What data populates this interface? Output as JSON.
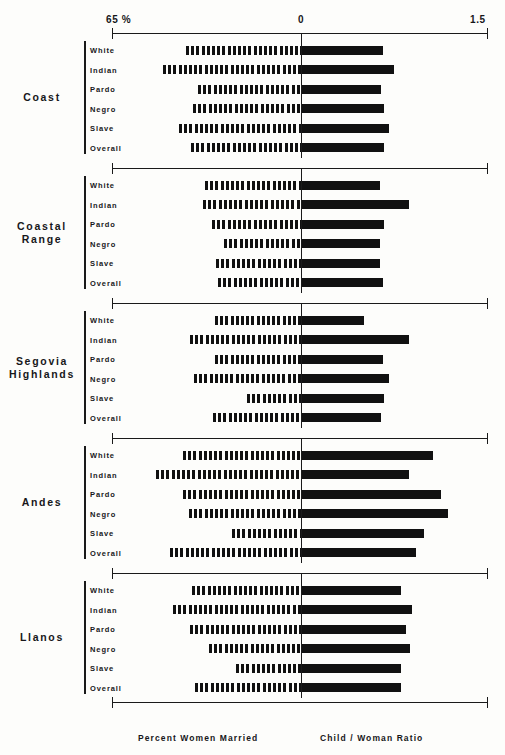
{
  "chart_data": {
    "type": "bar",
    "title": "",
    "subtitle": "",
    "orientation": "horizontal-bidirectional",
    "grid": false,
    "legend_position": "none",
    "left_axis": {
      "name": "Percent Women Married",
      "unit": "%",
      "ticks": [
        "65 %",
        "0"
      ],
      "range_label_left": "65 %",
      "zero_label": "0",
      "min": 0,
      "max": 65
    },
    "right_axis": {
      "name": "Child / Woman Ratio",
      "ticks": [
        "0",
        "1.5"
      ],
      "zero_label": "0",
      "range_label_right": "1.5",
      "min": 0,
      "max": 1.5
    },
    "axis_labels": {
      "left_end": "65 %",
      "center": "0",
      "right_end": "1.5"
    },
    "categories": [
      "White",
      "Indian",
      "Pardo",
      "Negro",
      "Slave",
      "Overall"
    ],
    "series": [
      {
        "name": "Percent Women Married",
        "axis": "left",
        "style": "hatched"
      },
      {
        "name": "Child / Woman Ratio",
        "axis": "right",
        "style": "solid"
      }
    ],
    "groups": [
      {
        "region": "Coast",
        "rows": [
          {
            "label": "White",
            "percent_women_married": 39.5,
            "child_woman_ratio": 0.65
          },
          {
            "label": "Indian",
            "percent_women_married": 47.4,
            "child_woman_ratio": 0.74
          },
          {
            "label": "Pardo",
            "percent_women_married": 35.4,
            "child_woman_ratio": 0.64
          },
          {
            "label": "Negro",
            "percent_women_married": 37.1,
            "child_woman_ratio": 0.66
          },
          {
            "label": "Slave",
            "percent_women_married": 41.9,
            "child_woman_ratio": 0.7
          },
          {
            "label": "Overall",
            "percent_women_married": 37.8,
            "child_woman_ratio": 0.66
          }
        ]
      },
      {
        "region": "Coastal Range",
        "rows": [
          {
            "label": "White",
            "percent_women_married": 33.0,
            "child_woman_ratio": 0.63
          },
          {
            "label": "Indian",
            "percent_women_married": 33.7,
            "child_woman_ratio": 0.86
          },
          {
            "label": "Pardo",
            "percent_women_married": 30.6,
            "child_woman_ratio": 0.66
          },
          {
            "label": "Negro",
            "percent_women_married": 26.4,
            "child_woman_ratio": 0.63
          },
          {
            "label": "Slave",
            "percent_women_married": 29.2,
            "child_woman_ratio": 0.63
          },
          {
            "label": "Overall",
            "percent_women_married": 28.5,
            "child_woman_ratio": 0.65
          }
        ]
      },
      {
        "region": "Segovia Highlands",
        "rows": [
          {
            "label": "White",
            "percent_women_married": 29.6,
            "child_woman_ratio": 0.5
          },
          {
            "label": "Indian",
            "percent_women_married": 38.2,
            "child_woman_ratio": 0.86
          },
          {
            "label": "Pardo",
            "percent_women_married": 29.6,
            "child_woman_ratio": 0.65
          },
          {
            "label": "Negro",
            "percent_women_married": 36.8,
            "child_woman_ratio": 0.7
          },
          {
            "label": "Slave",
            "percent_women_married": 18.6,
            "child_woman_ratio": 0.66
          },
          {
            "label": "Overall",
            "percent_women_married": 30.3,
            "child_woman_ratio": 0.64
          }
        ]
      },
      {
        "region": "Andes",
        "rows": [
          {
            "label": "White",
            "percent_women_married": 40.6,
            "child_woman_ratio": 1.06
          },
          {
            "label": "Indian",
            "percent_women_married": 49.9,
            "child_woman_ratio": 0.86
          },
          {
            "label": "Pardo",
            "percent_women_married": 40.6,
            "child_woman_ratio": 1.12
          },
          {
            "label": "Negro",
            "percent_women_married": 38.5,
            "child_woman_ratio": 1.18
          },
          {
            "label": "Slave",
            "percent_women_married": 23.7,
            "child_woman_ratio": 0.98
          },
          {
            "label": "Overall",
            "percent_women_married": 45.0,
            "child_woman_ratio": 0.92
          }
        ]
      },
      {
        "region": "Llanos",
        "rows": [
          {
            "label": "White",
            "percent_women_married": 37.5,
            "child_woman_ratio": 0.8
          },
          {
            "label": "Indian",
            "percent_women_married": 44.0,
            "child_woman_ratio": 0.89
          },
          {
            "label": "Pardo",
            "percent_women_married": 38.2,
            "child_woman_ratio": 0.84
          },
          {
            "label": "Negro",
            "percent_women_married": 31.8,
            "child_woman_ratio": 0.87
          },
          {
            "label": "Slave",
            "percent_women_married": 22.3,
            "child_woman_ratio": 0.8
          },
          {
            "label": "Overall",
            "percent_women_married": 36.5,
            "child_woman_ratio": 0.8
          }
        ]
      }
    ],
    "footer_captions": [
      "Percent  Women  Married",
      "Child / Woman  Ratio"
    ]
  },
  "geometry": {
    "x_left": 112,
    "x_zero": 301,
    "x_right": 487,
    "percent_max": 65,
    "ratio_max": 1.5,
    "group_tops": [
      41,
      176,
      311,
      446,
      581
    ],
    "row_pitch": 19.5,
    "row_offset": 9,
    "bar_height": 9,
    "axis_rule_offsets": [
      -8,
      112
    ]
  },
  "colors": {
    "ink": "#17171a",
    "bar": "#111111",
    "paper": "#fdfdfb"
  }
}
